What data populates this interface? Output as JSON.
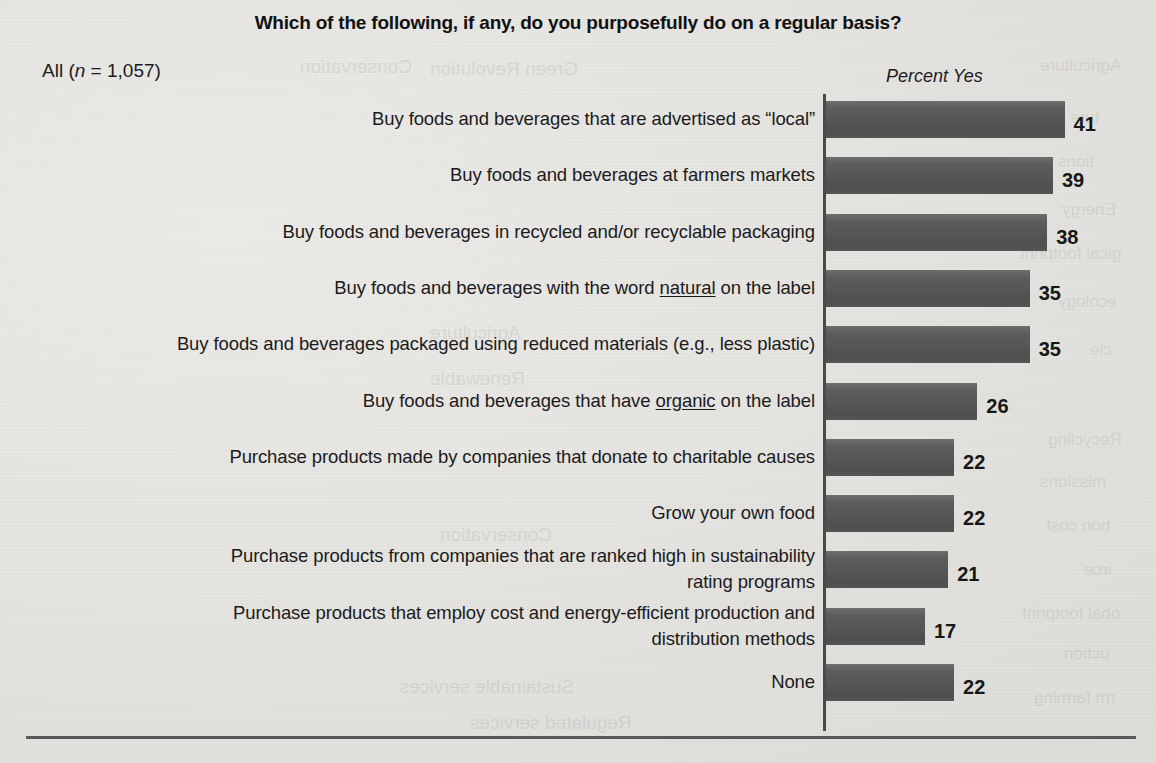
{
  "chart_data": {
    "type": "bar",
    "orientation": "horizontal",
    "title": "Which of the following, if any, do you purposefully do on a regular basis?",
    "subtitle": "All (n = 1,057)",
    "value_axis_label": "Percent Yes",
    "xlabel": "",
    "ylabel": "",
    "xlim": [
      0,
      45
    ],
    "grid": false,
    "legend": false,
    "value_suffix": "",
    "categories": [
      "Buy foods and beverages that are advertised as “local”",
      "Buy foods and beverages at farmers markets",
      "Buy foods and beverages in recycled and/or recyclable packaging",
      "Buy foods and beverages with the word natural on the label",
      "Buy foods and beverages packaged using reduced materials (e.g., less plastic)",
      "Buy foods and beverages that have organic on the label",
      "Purchase products made by companies that donate to charitable causes",
      "Grow your own food",
      "Purchase products from companies that are ranked high in sustainability rating programs",
      "Purchase products that employ cost and energy-efficient production and distribution methods",
      "None"
    ],
    "values": [
      41,
      39,
      38,
      35,
      35,
      26,
      22,
      22,
      21,
      17,
      22
    ],
    "series": [
      {
        "name": "Percent Yes",
        "values": [
          41,
          39,
          38,
          35,
          35,
          26,
          22,
          22,
          21,
          17,
          22
        ]
      }
    ]
  },
  "chart": {
    "title": "Which of the following, if any, do you purposefully do on a regular basis?",
    "sample_size_prefix": "All (",
    "sample_size_italic": "n",
    "sample_size_suffix": " = 1,057)",
    "axis_label": "Percent Yes",
    "rows": [
      {
        "label_html": "Buy foods and beverages that are advertised as “local”",
        "label_plain": "Buy foods and beverages that are advertised as “local”",
        "value": 41,
        "value_text": "41"
      },
      {
        "label_html": "Buy foods and beverages at farmers markets",
        "label_plain": "Buy foods and beverages at farmers markets",
        "value": 39,
        "value_text": "39"
      },
      {
        "label_html": "Buy foods and beverages in recycled and/or recyclable packaging",
        "label_plain": "Buy foods and beverages in recycled and/or recyclable packaging",
        "value": 38,
        "value_text": "38"
      },
      {
        "label_html": "Buy foods and beverages with the word <u>natural</u> on the label",
        "label_plain": "Buy foods and beverages with the word natural on the label",
        "value": 35,
        "value_text": "35"
      },
      {
        "label_html": "Buy foods and beverages packaged using reduced materials (e.g., less plastic)",
        "label_plain": "Buy foods and beverages packaged using reduced materials (e.g., less plastic)",
        "value": 35,
        "value_text": "35"
      },
      {
        "label_html": "Buy foods and beverages that have <u>organic</u> on the label",
        "label_plain": "Buy foods and beverages that have organic on the label",
        "value": 26,
        "value_text": "26"
      },
      {
        "label_html": "Purchase products made by companies that donate to charitable causes",
        "label_plain": "Purchase products made by companies that donate to charitable causes",
        "value": 22,
        "value_text": "22"
      },
      {
        "label_html": "Grow your own food",
        "label_plain": "Grow your own food",
        "value": 22,
        "value_text": "22"
      },
      {
        "label_html": "Purchase products from companies that are ranked high in sustainability<br>rating programs",
        "label_plain": "Purchase products from companies that are ranked high in sustainability rating programs",
        "value": 21,
        "value_text": "21"
      },
      {
        "label_html": "Purchase products that employ cost and energy-efficient production and<br>distribution methods",
        "label_plain": "Purchase products that employ cost and energy-efficient production and distribution methods",
        "value": 17,
        "value_text": "17"
      },
      {
        "label_html": "None",
        "label_plain": "None",
        "value": 22,
        "value_text": "22"
      }
    ]
  },
  "style": {
    "bar_color": "#565656",
    "axis_color": "#4a4a4a",
    "text_color": "#1b1b1b",
    "background_color": "#e3e3e1",
    "rule_color": "#58585a"
  },
  "ghost_bleed": [
    {
      "text": "Green Revolution",
      "x": 430,
      "y": 58,
      "size": 19
    },
    {
      "text": "Conservation",
      "x": 300,
      "y": 56,
      "size": 19
    },
    {
      "text": "Agriculture",
      "x": 1040,
      "y": 56,
      "size": 17
    },
    {
      "text": "ture",
      "x": 1070,
      "y": 108,
      "size": 17
    },
    {
      "text": "tions",
      "x": 1058,
      "y": 152,
      "size": 17
    },
    {
      "text": "Energy",
      "x": 1062,
      "y": 200,
      "size": 17
    },
    {
      "text": "gical footprint",
      "x": 1020,
      "y": 244,
      "size": 17
    },
    {
      "text": "ecology",
      "x": 1058,
      "y": 292,
      "size": 17
    },
    {
      "text": "cle",
      "x": 1090,
      "y": 340,
      "size": 17
    },
    {
      "text": "Recycling",
      "x": 1048,
      "y": 430,
      "size": 17
    },
    {
      "text": "missions",
      "x": 1040,
      "y": 472,
      "size": 17
    },
    {
      "text": "bon cost",
      "x": 1046,
      "y": 516,
      "size": 17
    },
    {
      "text": "irce",
      "x": 1084,
      "y": 560,
      "size": 17
    },
    {
      "text": "obal footprint",
      "x": 1022,
      "y": 604,
      "size": 17
    },
    {
      "text": "uction",
      "x": 1064,
      "y": 644,
      "size": 17
    },
    {
      "text": "rm farming",
      "x": 1034,
      "y": 688,
      "size": 17
    },
    {
      "text": "Agriculture",
      "x": 430,
      "y": 322,
      "size": 19
    },
    {
      "text": "Renewable",
      "x": 430,
      "y": 368,
      "size": 19
    },
    {
      "text": "Conservation",
      "x": 440,
      "y": 524,
      "size": 19
    },
    {
      "text": "Sustainable services",
      "x": 400,
      "y": 676,
      "size": 19
    },
    {
      "text": "Regulated services",
      "x": 470,
      "y": 712,
      "size": 19
    }
  ]
}
